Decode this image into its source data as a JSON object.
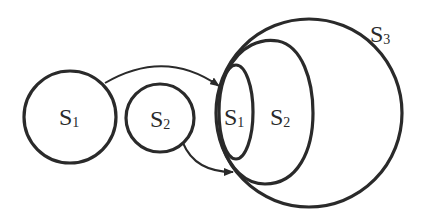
{
  "diagram": {
    "type": "set-inclusion",
    "colors": {
      "stroke": "#2a2a2a",
      "background": "#ffffff"
    },
    "left": {
      "set_s1": {
        "letter": "S",
        "subscript": "1"
      },
      "set_s2": {
        "letter": "S",
        "subscript": "2"
      }
    },
    "right": {
      "inner_s1": {
        "letter": "S",
        "subscript": "1"
      },
      "middle_s2": {
        "letter": "S",
        "subscript": "2"
      },
      "outer_s3": {
        "letter": "S",
        "subscript": "3"
      }
    },
    "arrows": [
      {
        "from": "S1",
        "to": "inner S1"
      },
      {
        "from": "S2",
        "to": "middle S2"
      }
    ]
  }
}
